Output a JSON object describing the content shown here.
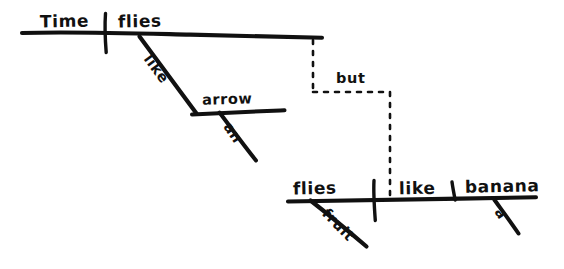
{
  "figure": {
    "kind": "reed-kellogg-sentence-diagram",
    "style": "hand-drawn ink on white paper",
    "width": 564,
    "height": 269,
    "ink_color": "#111111",
    "paper_color": "#ffffff",
    "sentence": "Time flies like an arrow, but fruit flies like a banana."
  },
  "clauses": [
    {
      "id": "clause-top",
      "subject": "Time",
      "verb": "flies",
      "baseline": {
        "x1": 22,
        "y1": 33,
        "x2": 322,
        "y2": 38
      },
      "subject_verb_divider": {
        "x": 105,
        "y_top": 14,
        "y_bottom": 52
      },
      "modifiers": [
        {
          "id": "like",
          "label": "like",
          "role": "preposition",
          "rotation_deg": 54
        },
        {
          "id": "arrow",
          "label": "arrow",
          "role": "object-of-preposition",
          "rotation_deg": 0
        },
        {
          "id": "an",
          "label": "an",
          "role": "article",
          "rotation_deg": 54
        }
      ]
    },
    {
      "id": "clause-bottom",
      "subject": "flies",
      "verb": "like",
      "object": "banana",
      "baseline": {
        "x1": 288,
        "y1": 201,
        "x2": 536,
        "y2": 197
      },
      "subject_verb_divider": {
        "x": 374,
        "y_top": 180,
        "y_bottom": 220
      },
      "verb_object_divider": {
        "x": 452,
        "y_top": 182,
        "y_bottom": 199
      },
      "modifiers": [
        {
          "id": "fruit",
          "label": "fruit",
          "role": "adjective",
          "rotation_deg": 46
        },
        {
          "id": "a",
          "label": "a",
          "role": "article",
          "rotation_deg": 56
        }
      ]
    }
  ],
  "conjunction": {
    "label": "but",
    "style": "dashed",
    "connects": [
      "clause-top",
      "clause-bottom"
    ],
    "path": [
      {
        "x": 313,
        "y": 40
      },
      {
        "x": 313,
        "y": 92
      },
      {
        "x": 390,
        "y": 92
      },
      {
        "x": 390,
        "y": 198
      }
    ],
    "label_position": {
      "x": 336,
      "y": 70
    }
  },
  "labels": {
    "time": "Time",
    "flies_top": "flies",
    "like_top": "like",
    "arrow": "arrow",
    "an": "an",
    "but": "but",
    "flies_bottom": "flies",
    "like_bottom": "like",
    "banana": "banana",
    "fruit": "fruit",
    "a": "a"
  },
  "strokes": {
    "baseline_top": "M22,33 L322,38",
    "divider_top": "M105,14 L106,52",
    "like_slant_top": "M140,37 L196,113",
    "arrow_line": "M193,114 L284,110",
    "an_slant": "M220,113 L256,160",
    "baseline_bottom": "M288,201 L536,197",
    "divider_bottom_1": "M374,181 L375,220",
    "divider_bottom_2": "M452,182 L455,200",
    "fruit_slant": "M311,201 L366,246",
    "a_slant": "M495,200 L518,233"
  }
}
